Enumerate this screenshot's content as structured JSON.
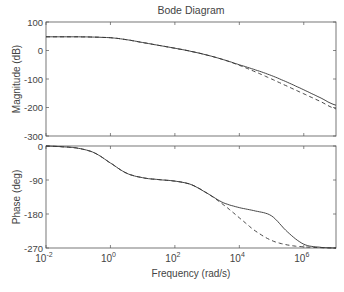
{
  "chart_data": {
    "type": "line",
    "title": "Bode Diagram",
    "xlabel": "Frequency  (rad/s)",
    "xscale": "log",
    "xlim": [
      0.01,
      10000000
    ],
    "x_ticks": [
      {
        "value": 0.01,
        "base": "10",
        "exp": "-2"
      },
      {
        "value": 1,
        "base": "10",
        "exp": "0"
      },
      {
        "value": 100,
        "base": "10",
        "exp": "2"
      },
      {
        "value": 10000,
        "base": "10",
        "exp": "4"
      },
      {
        "value": 1000000,
        "base": "10",
        "exp": "6"
      }
    ],
    "grid": false,
    "subplots": [
      {
        "name": "magnitude",
        "ylabel": "Magnitude (dB)",
        "ylim": [
          -300,
          100
        ],
        "y_ticks": [
          "100",
          "0",
          "-100",
          "-200",
          "-300"
        ],
        "y_tick_values": [
          100,
          0,
          -100,
          -200,
          -300
        ],
        "series": [
          {
            "name": "system-solid",
            "style": "solid",
            "x_log10": [
              -2,
              -1,
              0,
              0.5,
              1,
              1.5,
              2,
              2.5,
              3,
              3.5,
              4,
              4.5,
              5,
              5.5,
              6,
              6.5,
              7
            ],
            "values": [
              48,
              48,
              45,
              38,
              28,
              18,
              8,
              -3,
              -16,
              -32,
              -50,
              -68,
              -88,
              -112,
              -138,
              -165,
              -192
            ]
          },
          {
            "name": "approximation-dashed",
            "style": "dashed",
            "x_log10": [
              -2,
              -1,
              0,
              0.5,
              1,
              1.5,
              2,
              2.5,
              3,
              3.5,
              4,
              4.5,
              5,
              5.5,
              6,
              6.5,
              7
            ],
            "values": [
              48,
              48,
              45,
              38,
              28,
              18,
              8,
              -3,
              -16,
              -32,
              -52,
              -75,
              -100,
              -126,
              -152,
              -178,
              -205
            ]
          }
        ]
      },
      {
        "name": "phase",
        "ylabel": "Phase (deg)",
        "ylim": [
          -270,
          0
        ],
        "y_ticks": [
          "0",
          "-90",
          "-180",
          "-270"
        ],
        "y_tick_values": [
          0,
          -90,
          -180,
          -270
        ],
        "series": [
          {
            "name": "system-solid",
            "style": "solid",
            "x_log10": [
              -2,
              -1.5,
              -1,
              -0.5,
              0,
              0.5,
              1,
              1.5,
              2,
              2.5,
              3,
              3.5,
              4,
              4.5,
              5,
              5.5,
              6,
              6.5,
              7
            ],
            "values": [
              0,
              -2,
              -6,
              -18,
              -45,
              -72,
              -84,
              -89,
              -93,
              -102,
              -125,
              -150,
              -163,
              -172,
              -185,
              -228,
              -260,
              -268,
              -270
            ]
          },
          {
            "name": "approximation-dashed",
            "style": "dashed",
            "x_log10": [
              -2,
              -1.5,
              -1,
              -0.5,
              0,
              0.5,
              1,
              1.5,
              2,
              2.5,
              3,
              3.5,
              4,
              4.5,
              5,
              5.5,
              6,
              6.5,
              7
            ],
            "values": [
              0,
              -2,
              -6,
              -18,
              -45,
              -72,
              -84,
              -89,
              -93,
              -102,
              -125,
              -155,
              -190,
              -225,
              -250,
              -262,
              -267,
              -269,
              -270
            ]
          }
        ]
      }
    ]
  }
}
